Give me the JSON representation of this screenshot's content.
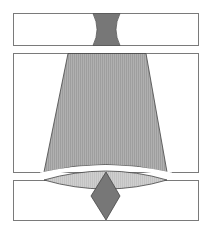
{
  "diagram": {
    "width": 212,
    "height": 229,
    "colors": {
      "background": "#ffffff",
      "frame_stroke": "#7a7a7a",
      "dark_fill": "#777777",
      "medium_fill": "#a9a9a9",
      "light_fill": "#c8c8c8",
      "shape_stroke": "#444444"
    },
    "panels": [
      {
        "name": "top-panel",
        "x": 13,
        "y": 13,
        "w": 185,
        "h": 32
      },
      {
        "name": "middle-panel",
        "x": 13,
        "y": 53,
        "w": 185,
        "h": 119
      },
      {
        "name": "bottom-panel",
        "x": 13,
        "y": 180,
        "w": 185,
        "h": 40
      }
    ],
    "shapes": {
      "top_hourglass": "concave-sided dark gray neck",
      "middle_trapezoid": "widening gray beam with curved bottom",
      "bottom_lens": "light gray ellipse lens",
      "bottom_diamond": "dark gray diamond"
    }
  }
}
